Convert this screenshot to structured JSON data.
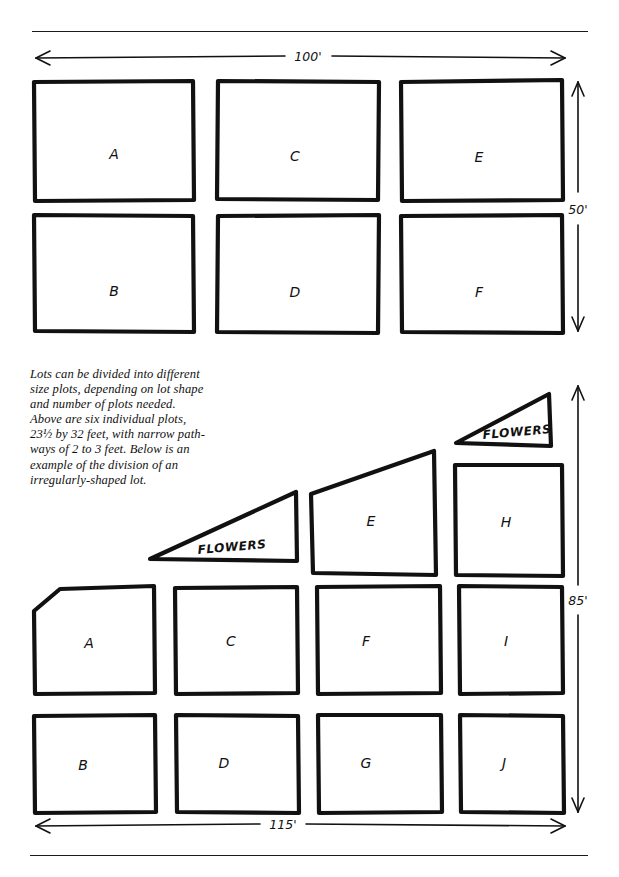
{
  "page": {
    "background_color": "#ffffff",
    "ink_color": "#111111",
    "rules": {
      "top": "",
      "bottom": ""
    }
  },
  "caption": {
    "lines": [
      "Lots can be divided into different",
      "size plots, depending on lot shape",
      "and number of plots needed.",
      "Above are six individual plots,",
      "23½ by 32 feet, with narrow path-",
      "ways of 2 to 3 feet. Below is an",
      "example of the division of an",
      "irregularly-shaped lot."
    ],
    "text": "Lots can be divided into different size plots, depending on lot shape and number of plots needed. Above are six individual plots, 23½ by 32 feet, with narrow pathways of 2 to 3 feet. Below is an example of the division of an irregularly-shaped lot."
  },
  "top_diagram": {
    "name": "regular-rectangular-lot",
    "width_label": "100'",
    "height_label": "50'",
    "plots": [
      {
        "id": "A",
        "label": "A",
        "row": 1,
        "col": 1,
        "shape": "rectangle"
      },
      {
        "id": "C",
        "label": "C",
        "row": 1,
        "col": 2,
        "shape": "rectangle"
      },
      {
        "id": "E",
        "label": "E",
        "row": 1,
        "col": 3,
        "shape": "rectangle"
      },
      {
        "id": "B",
        "label": "B",
        "row": 2,
        "col": 1,
        "shape": "rectangle"
      },
      {
        "id": "D",
        "label": "D",
        "row": 2,
        "col": 2,
        "shape": "rectangle"
      },
      {
        "id": "F",
        "label": "F",
        "row": 2,
        "col": 3,
        "shape": "rectangle"
      }
    ],
    "plot_count": 6,
    "plot_size": "23½ by 32 feet",
    "path_width": "2 to 3 feet"
  },
  "bottom_diagram": {
    "name": "irregularly-shaped-lot",
    "width_label": "115'",
    "height_label": "85'",
    "plots": [
      {
        "id": "A",
        "label": "A",
        "shape": "beveled-corner"
      },
      {
        "id": "B",
        "label": "B",
        "shape": "rectangle"
      },
      {
        "id": "C",
        "label": "C",
        "shape": "rectangle"
      },
      {
        "id": "D",
        "label": "D",
        "shape": "rectangle"
      },
      {
        "id": "E",
        "label": "E",
        "shape": "trapezoid"
      },
      {
        "id": "F",
        "label": "F",
        "shape": "rectangle"
      },
      {
        "id": "G",
        "label": "G",
        "shape": "rectangle"
      },
      {
        "id": "H",
        "label": "H",
        "shape": "rectangle"
      },
      {
        "id": "I",
        "label": "I",
        "shape": "rectangle"
      },
      {
        "id": "J",
        "label": "J",
        "shape": "rectangle"
      }
    ],
    "plot_count": 10,
    "flower_beds": [
      {
        "id": "flowers-lower",
        "label": "FLOWERS",
        "shape": "triangle"
      },
      {
        "id": "flowers-upper",
        "label": "FLOWERS",
        "shape": "triangle"
      }
    ]
  }
}
